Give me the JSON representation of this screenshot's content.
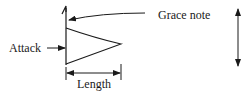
{
  "diagram": {
    "labels": {
      "grace_note": "Grace note",
      "attack": "Attack",
      "length": "Length"
    },
    "stroke_color": "#1a1a1a",
    "background": "#ffffff"
  }
}
